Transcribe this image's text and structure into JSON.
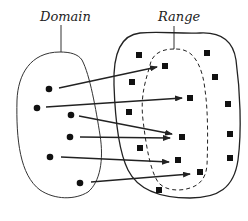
{
  "diagram": {
    "type": "function-mapping",
    "labels": {
      "domain": "Domain",
      "range": "Range"
    },
    "colors": {
      "stroke": "#222222",
      "fill": "#111111",
      "background": "#ffffff"
    },
    "domain_points": [
      {
        "x": 49,
        "y": 89
      },
      {
        "x": 37,
        "y": 108
      },
      {
        "x": 71,
        "y": 115
      },
      {
        "x": 70,
        "y": 137
      },
      {
        "x": 50,
        "y": 157
      },
      {
        "x": 80,
        "y": 183
      }
    ],
    "codomain_points": [
      {
        "x": 139,
        "y": 55,
        "in_range": false
      },
      {
        "x": 207,
        "y": 53,
        "in_range": false
      },
      {
        "x": 165,
        "y": 66,
        "in_range": true
      },
      {
        "x": 215,
        "y": 77,
        "in_range": false
      },
      {
        "x": 132,
        "y": 82,
        "in_range": false
      },
      {
        "x": 190,
        "y": 98,
        "in_range": true
      },
      {
        "x": 228,
        "y": 104,
        "in_range": false
      },
      {
        "x": 129,
        "y": 112,
        "in_range": false
      },
      {
        "x": 182,
        "y": 137,
        "in_range": true
      },
      {
        "x": 230,
        "y": 134,
        "in_range": false
      },
      {
        "x": 140,
        "y": 148,
        "in_range": false
      },
      {
        "x": 178,
        "y": 160,
        "in_range": true
      },
      {
        "x": 230,
        "y": 158,
        "in_range": false
      },
      {
        "x": 200,
        "y": 172,
        "in_range": true
      },
      {
        "x": 159,
        "y": 190,
        "in_range": false
      }
    ],
    "mappings": [
      {
        "from": [
          59,
          88
        ],
        "to": [
          157,
          67
        ]
      },
      {
        "from": [
          46,
          107
        ],
        "to": [
          182,
          98
        ]
      },
      {
        "from": [
          79,
          116
        ],
        "to": [
          172,
          134
        ]
      },
      {
        "from": [
          80,
          137
        ],
        "to": [
          170,
          138
        ]
      },
      {
        "from": [
          61,
          157
        ],
        "to": [
          169,
          162
        ]
      },
      {
        "from": [
          91,
          182
        ],
        "to": [
          190,
          174
        ]
      }
    ]
  }
}
